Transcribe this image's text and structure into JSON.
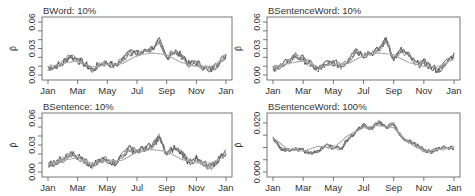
{
  "figure": {
    "x_tick_labels": [
      "Jan",
      "Mar",
      "May",
      "Jul",
      "Sep",
      "Nov",
      "Jan"
    ],
    "y_label": "p̂"
  },
  "chart_data": [
    {
      "type": "line",
      "title": "BWord: 10%",
      "xlabel": "",
      "ylabel": "p̂",
      "x_tick_labels": [
        "Jan",
        "Mar",
        "May",
        "Jul",
        "Sep",
        "Nov",
        "Jan"
      ],
      "y_tick_labels": [
        "0.00",
        "0.03",
        "0.06"
      ],
      "ylim": [
        0,
        0.065
      ],
      "grid": false,
      "series": [
        {
          "name": "estimate",
          "x_month": [
            0,
            0.5,
            1,
            1.5,
            2,
            2.5,
            3,
            3.5,
            4,
            4.5,
            5,
            5.5,
            6,
            6.5,
            7,
            7.5,
            8,
            8.5,
            9,
            9.5,
            10,
            10.5,
            11,
            11.5,
            12
          ],
          "values": [
            0.008,
            0.01,
            0.014,
            0.022,
            0.017,
            0.012,
            0.006,
            0.012,
            0.014,
            0.01,
            0.017,
            0.026,
            0.024,
            0.026,
            0.03,
            0.038,
            0.02,
            0.027,
            0.022,
            0.012,
            0.014,
            0.009,
            0.006,
            0.014,
            0.022
          ]
        },
        {
          "name": "reference",
          "x_month": [
            0,
            1,
            2,
            3,
            4,
            5,
            6,
            7,
            8,
            9,
            10,
            11,
            12
          ],
          "values": [
            0.009,
            0.013,
            0.016,
            0.009,
            0.012,
            0.013,
            0.022,
            0.025,
            0.023,
            0.014,
            0.01,
            0.01,
            0.018
          ]
        }
      ]
    },
    {
      "type": "line",
      "title": "BSentenceWord: 10%",
      "xlabel": "",
      "ylabel": "p̂",
      "x_tick_labels": [
        "Jan",
        "Mar",
        "May",
        "Jul",
        "Sep",
        "Nov",
        "Jan"
      ],
      "y_tick_labels": [
        "0.00",
        "0.03",
        "0.06"
      ],
      "ylim": [
        0,
        0.065
      ],
      "grid": false,
      "series": [
        {
          "name": "estimate",
          "x_month": [
            0,
            0.5,
            1,
            1.5,
            2,
            2.5,
            3,
            3.5,
            4,
            4.5,
            5,
            5.5,
            6,
            6.5,
            7,
            7.5,
            8,
            8.5,
            9,
            9.5,
            10,
            10.5,
            11,
            11.5,
            12
          ],
          "values": [
            0.008,
            0.01,
            0.015,
            0.022,
            0.018,
            0.012,
            0.006,
            0.013,
            0.014,
            0.01,
            0.017,
            0.027,
            0.023,
            0.025,
            0.028,
            0.04,
            0.018,
            0.028,
            0.022,
            0.012,
            0.014,
            0.009,
            0.005,
            0.015,
            0.023
          ]
        },
        {
          "name": "reference",
          "x_month": [
            0,
            1,
            2,
            3,
            4,
            5,
            6,
            7,
            8,
            9,
            10,
            11,
            12
          ],
          "values": [
            0.009,
            0.013,
            0.016,
            0.009,
            0.012,
            0.013,
            0.022,
            0.025,
            0.023,
            0.014,
            0.01,
            0.01,
            0.018
          ]
        }
      ]
    },
    {
      "type": "line",
      "title": "BSentence: 10%",
      "xlabel": "",
      "ylabel": "p̂",
      "x_tick_labels": [
        "Jan",
        "Mar",
        "May",
        "Jul",
        "Sep",
        "Nov",
        "Jan"
      ],
      "y_tick_labels": [
        "0.00",
        "0.03",
        "0.06"
      ],
      "ylim": [
        0,
        0.065
      ],
      "grid": false,
      "series": [
        {
          "name": "estimate",
          "x_month": [
            0,
            0.5,
            1,
            1.5,
            2,
            2.5,
            3,
            3.5,
            4,
            4.5,
            5,
            5.5,
            6,
            6.5,
            7,
            7.5,
            8,
            8.5,
            9,
            9.5,
            10,
            10.5,
            11,
            11.5,
            12
          ],
          "values": [
            0.008,
            0.011,
            0.014,
            0.021,
            0.017,
            0.011,
            0.006,
            0.013,
            0.014,
            0.01,
            0.018,
            0.026,
            0.023,
            0.026,
            0.029,
            0.039,
            0.019,
            0.027,
            0.022,
            0.011,
            0.014,
            0.009,
            0.005,
            0.014,
            0.022
          ]
        },
        {
          "name": "reference",
          "x_month": [
            0,
            1,
            2,
            3,
            4,
            5,
            6,
            7,
            8,
            9,
            10,
            11,
            12
          ],
          "values": [
            0.009,
            0.013,
            0.016,
            0.009,
            0.012,
            0.013,
            0.022,
            0.025,
            0.023,
            0.014,
            0.01,
            0.01,
            0.018
          ]
        }
      ]
    },
    {
      "type": "line",
      "title": "BSentenceWord: 100%",
      "xlabel": "",
      "ylabel": "p̂",
      "x_tick_labels": [
        "Jan",
        "Mar",
        "May",
        "Jul",
        "Sep",
        "Nov",
        "Jan"
      ],
      "y_tick_labels": [
        "0.000",
        "0.020"
      ],
      "ylim": [
        0,
        0.025
      ],
      "grid": false,
      "series": [
        {
          "name": "estimate",
          "x_month": [
            0,
            0.5,
            1,
            1.5,
            2,
            2.5,
            3,
            3.5,
            4,
            4.5,
            5,
            5.5,
            6,
            6.5,
            7,
            7.5,
            8,
            8.5,
            9,
            9.5,
            10,
            10.5,
            11,
            11.5,
            12
          ],
          "values": [
            0.014,
            0.0095,
            0.009,
            0.0095,
            0.0088,
            0.0078,
            0.0082,
            0.011,
            0.01,
            0.0095,
            0.0135,
            0.0165,
            0.019,
            0.0175,
            0.0205,
            0.018,
            0.0195,
            0.0145,
            0.0125,
            0.011,
            0.0088,
            0.0082,
            0.0098,
            0.0095,
            0.0102
          ]
        },
        {
          "name": "reference",
          "x_month": [
            0,
            1,
            2,
            3,
            4,
            5,
            6,
            7,
            8,
            9,
            10,
            11,
            12
          ],
          "values": [
            0.014,
            0.0092,
            0.0085,
            0.0105,
            0.0098,
            0.015,
            0.018,
            0.019,
            0.018,
            0.012,
            0.0085,
            0.0092,
            0.01
          ]
        }
      ]
    }
  ]
}
